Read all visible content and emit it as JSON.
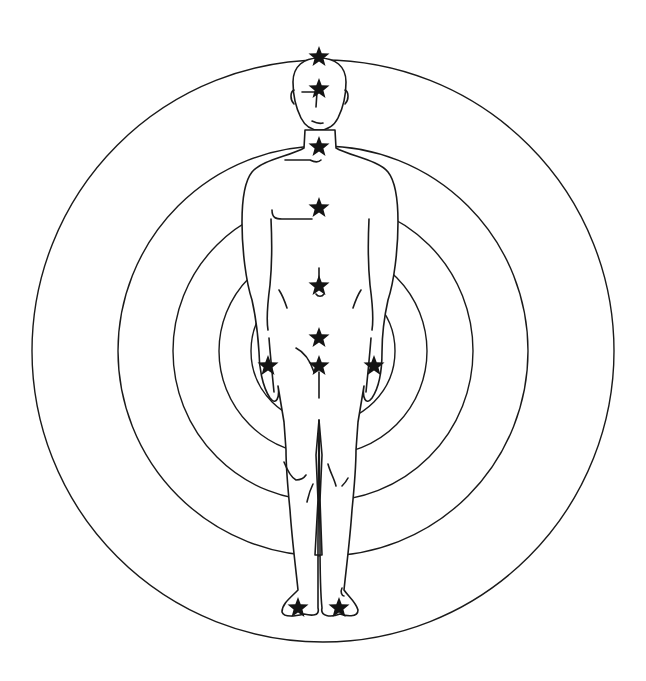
{
  "figure": {
    "title": "Human figure with energy points and concentric circles",
    "ink_color": "#1a1a1a",
    "background": "#ffffff"
  },
  "rings": {
    "center": [
      323,
      351
    ],
    "radii": [
      72,
      104,
      150,
      205,
      291
    ]
  },
  "points": [
    {
      "name": "crown",
      "x": 319,
      "y": 57
    },
    {
      "name": "brow",
      "x": 319,
      "y": 89
    },
    {
      "name": "throat",
      "x": 319,
      "y": 147
    },
    {
      "name": "heart",
      "x": 319,
      "y": 208
    },
    {
      "name": "solar-plexus",
      "x": 319,
      "y": 286
    },
    {
      "name": "sacral",
      "x": 319,
      "y": 338
    },
    {
      "name": "left-hand",
      "x": 268,
      "y": 366
    },
    {
      "name": "root",
      "x": 319,
      "y": 366
    },
    {
      "name": "right-hand",
      "x": 374,
      "y": 366
    },
    {
      "name": "left-foot",
      "x": 298,
      "y": 608
    },
    {
      "name": "right-foot",
      "x": 339,
      "y": 608
    }
  ]
}
